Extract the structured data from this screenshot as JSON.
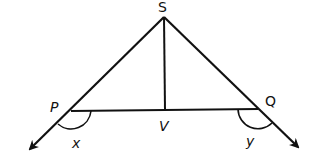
{
  "diagram": {
    "type": "geometry",
    "points": {
      "S": {
        "label": "S"
      },
      "P": {
        "label": "P"
      },
      "Q": {
        "label": "Q"
      },
      "V": {
        "label": "V"
      }
    },
    "angles": {
      "x": {
        "label": "x",
        "at": "P"
      },
      "y": {
        "label": "y",
        "at": "Q"
      }
    },
    "segments": [
      "SP",
      "SQ",
      "SV",
      "PQ"
    ],
    "rays": [
      "SP extended beyond P",
      "SQ extended beyond Q"
    ],
    "line_color": "#111111"
  }
}
